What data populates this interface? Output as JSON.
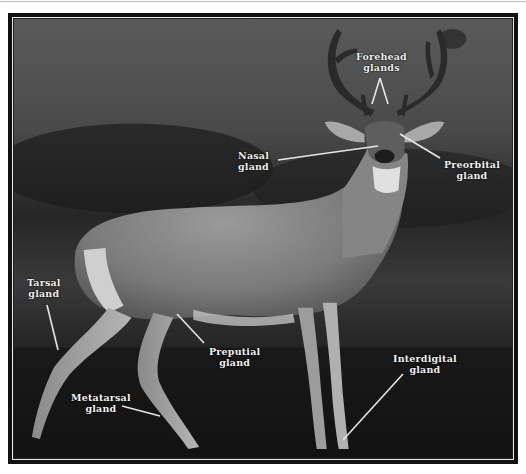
{
  "figure": {
    "colors": {
      "background_page": "#ffffff",
      "frame": "#111111",
      "label_text": "#f2f2f2",
      "leader_line": "#e6e6e6"
    },
    "labels": [
      {
        "id": "forehead",
        "line1": "Forehead",
        "line2": "glands"
      },
      {
        "id": "nasal",
        "line1": "Nasal",
        "line2": "gland"
      },
      {
        "id": "preorbital",
        "line1": "Preorbital",
        "line2": "gland"
      },
      {
        "id": "tarsal",
        "line1": "Tarsal",
        "line2": "gland"
      },
      {
        "id": "preputial",
        "line1": "Preputial",
        "line2": "gland"
      },
      {
        "id": "metatarsal",
        "line1": "Metatarsal",
        "line2": "gland"
      },
      {
        "id": "interdigital",
        "line1": "Interdigital",
        "line2": "gland"
      }
    ]
  }
}
